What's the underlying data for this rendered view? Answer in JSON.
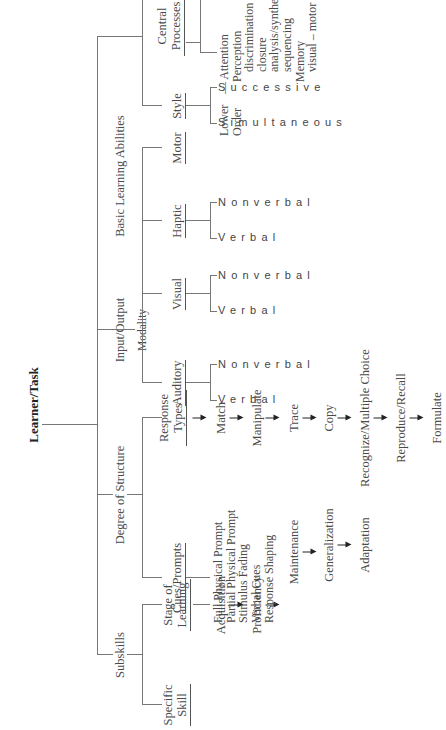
{
  "root": {
    "label": "Learner/Task"
  },
  "branches": {
    "subskills": {
      "label": "Subskills",
      "specific_skill": "Specific Skill",
      "stage_of_learning": "Stage of Learning",
      "stages": [
        "Acquisition",
        "Proficiency",
        "Maintenance",
        "Generalization",
        "Adaptation"
      ]
    },
    "degree_of_structure": {
      "label": "Degree of Structure",
      "cues_prompts": {
        "label": "Cues/Prompts",
        "items": [
          "Full Physical Prompt",
          "Partial Physical Prompt",
          "Stimulus Fading",
          "Verbal Cues",
          "Response Shaping"
        ]
      },
      "response_types": {
        "label": "Response Types",
        "items": [
          "Match",
          "Manipulate",
          "Trace",
          "Copy",
          "Recognize/Multiple Choice",
          "Reproduce/Recall",
          "Formulate"
        ]
      }
    },
    "input_output": {
      "label": "Input/Output",
      "modality_label": "Modality",
      "modalities": [
        {
          "label": "Auditory",
          "verbal": "Verbal",
          "nonverbal": "Nonverbal"
        },
        {
          "label": "Visual",
          "verbal": "Verbal",
          "nonverbal": "Nonverbal"
        },
        {
          "label": "Haptic",
          "verbal": "Verbal",
          "nonverbal": "Nonverbal"
        },
        {
          "label": "Motor"
        }
      ]
    },
    "basic_learning_abilities": {
      "label": "Basic Learning Abilities",
      "style": {
        "label": "Style",
        "items": [
          "Simultaneous",
          "Successive"
        ]
      },
      "central_processes": {
        "label": "Central Processes",
        "lower_order": {
          "label_1": "Lower",
          "label_2": "Order",
          "items": [
            "Attention",
            "Perception",
            "discrimination",
            "closure",
            "analysis/synthesis",
            "sequencing",
            "Memory",
            "visual – motor integration"
          ]
        },
        "higher_order": {
          "label_1": "Higher",
          "label_2": "Order",
          "items": [
            "Symbol/Representation",
            "Conceptual/Reasoning",
            "organization",
            "cognitive flexibility",
            "Speed of Processing",
            "Automaticity"
          ]
        }
      }
    }
  }
}
